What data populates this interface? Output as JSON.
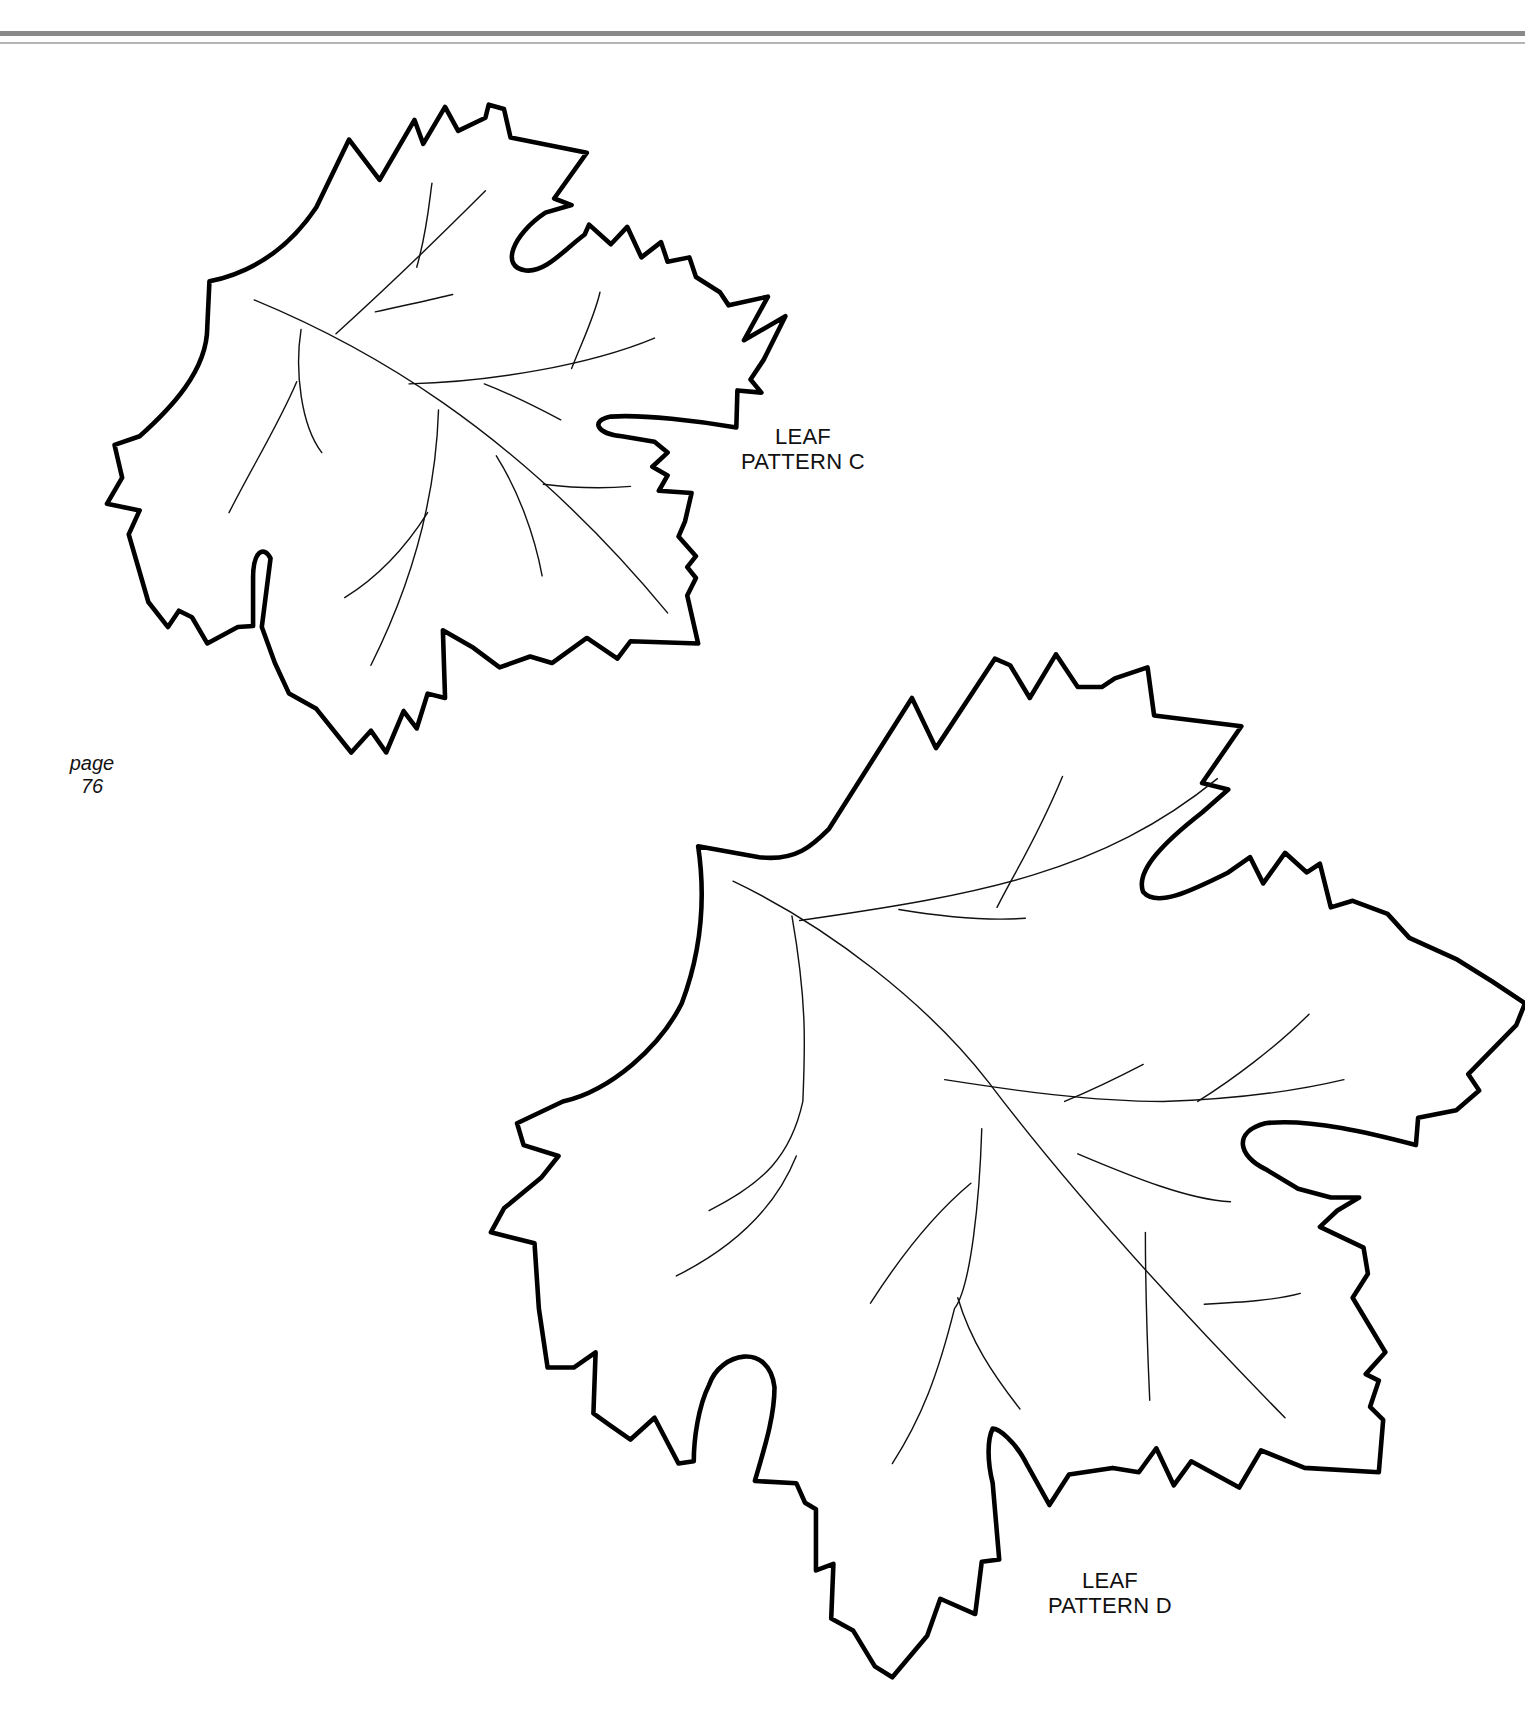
{
  "page": {
    "header_rules": [
      "thick-gray-rule",
      "thin-gray-rule"
    ],
    "page_label": {
      "word": "page",
      "number": "76"
    }
  },
  "patterns": [
    {
      "id": "C",
      "line1": "LEAF",
      "line2": "PATTERN C"
    },
    {
      "id": "D",
      "line1": "LEAF",
      "line2": "PATTERN D"
    }
  ],
  "colors": {
    "background": "#ffffff",
    "ink": "#000000",
    "rule": "#8a8a8a"
  }
}
